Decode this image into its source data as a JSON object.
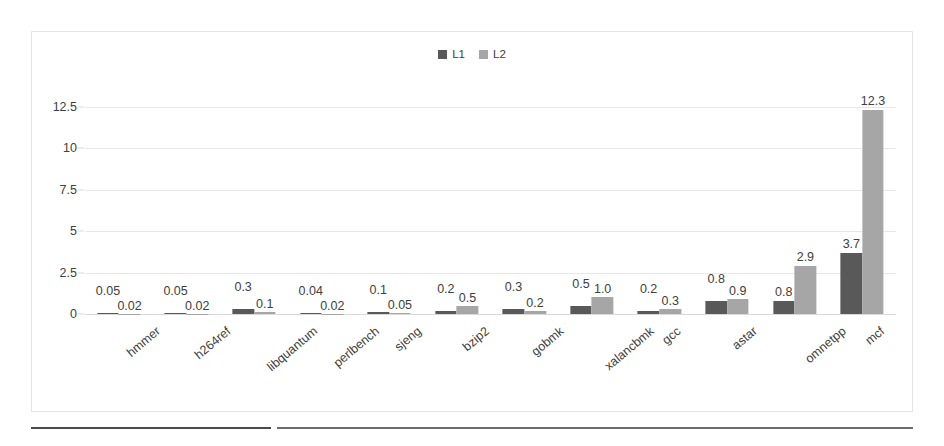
{
  "chart_data": {
    "type": "bar",
    "title": "",
    "subtitle": "",
    "xlabel": "",
    "ylabel": "",
    "ylim": [
      0,
      13.75
    ],
    "grid": true,
    "legend_position": "top-center",
    "yticks": [
      "0",
      "2.5",
      "5",
      "7.5",
      "10",
      "12.5"
    ],
    "ytick_values": [
      0,
      2.5,
      5,
      7.5,
      10,
      12.5
    ],
    "categories": [
      "hmmer",
      "h264ref",
      "libquantum",
      "perlbench",
      "sjeng",
      "bzip2",
      "gobmk",
      "xalancbmk",
      "gcc",
      "astar",
      "omnetpp",
      "mcf"
    ],
    "series": [
      {
        "name": "L1",
        "color": "#595959",
        "values": [
          0.05,
          0.05,
          0.3,
          0.04,
          0.1,
          0.2,
          0.3,
          0.5,
          0.2,
          0.8,
          0.8,
          3.7
        ],
        "labels": [
          "0.05",
          "0.05",
          "0.3",
          "0.04",
          "0.1",
          "0.2",
          "0.3",
          "0.5",
          "0.2",
          "0.8",
          "0.8",
          "3.7"
        ]
      },
      {
        "name": "L2",
        "color": "#a6a6a6",
        "values": [
          0.02,
          0.02,
          0.1,
          0.02,
          0.05,
          0.5,
          0.2,
          1.0,
          0.3,
          0.9,
          2.9,
          12.3
        ],
        "labels": [
          "0.02",
          "0.02",
          "0.1",
          "0.02",
          "0.05",
          "0.5",
          "0.2",
          "1.0",
          "0.3",
          "0.9",
          "2.9",
          "12.3"
        ]
      }
    ]
  },
  "legend": {
    "items": [
      {
        "label": "L1",
        "color": "#595959"
      },
      {
        "label": "L2",
        "color": "#a6a6a6"
      }
    ]
  }
}
